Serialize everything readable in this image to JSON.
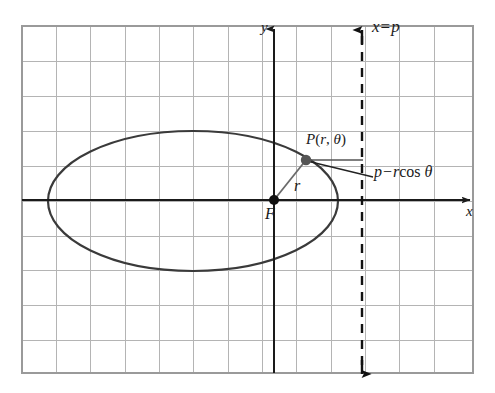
{
  "figure": {
    "kind": "polar-conic-diagram",
    "caption_glyph_partial": "g",
    "background_color": "#ffffff",
    "grid": {
      "visible": true,
      "line_color": "#b4b4b4",
      "border_color": "#9a9a9a",
      "cell_size_px": 34,
      "left_px": 22,
      "top_px": 26,
      "right_px": 473,
      "bottom_px": 373,
      "columns": 13,
      "rows": 10
    },
    "axes": {
      "color": "#1a1a1a",
      "x_axis": {
        "label": "x",
        "y_px": 200,
        "x_start_px": 22,
        "x_end_px": 477,
        "arrow": "right"
      },
      "y_axis": {
        "label": "y",
        "x_px": 274,
        "y_start_px": 373,
        "y_end_px": 22,
        "arrow": "up"
      },
      "origin_px": [
        274,
        200
      ]
    },
    "ellipse": {
      "stroke_color": "#3a3a3a",
      "stroke_width": 2.2,
      "center_px": [
        193,
        201
      ],
      "rx_px": 145,
      "ry_px": 70
    },
    "directrix": {
      "label": "x = p",
      "label_parts": {
        "var": "x",
        "op": "=",
        "param": "p"
      },
      "x_px": 362,
      "y_top_px": 26,
      "y_bottom_px": 377,
      "style": "dashed",
      "color": "#111111",
      "arrow_top": true,
      "arrow_bottom": true
    },
    "focus": {
      "label": "F",
      "point_px": [
        274,
        200
      ],
      "dot_radius_px": 5,
      "dot_color": "#111111"
    },
    "point_p": {
      "label": "P(r, θ)",
      "label_parts": {
        "name": "P",
        "open": "(",
        "r": "r",
        "comma": ", ",
        "theta": "θ",
        "close": ")"
      },
      "point_px": [
        306,
        160
      ],
      "dot_radius_px": 5,
      "dot_color": "#555555"
    },
    "radius": {
      "label": "r",
      "from_px": [
        274,
        200
      ],
      "to_px": [
        306,
        160
      ],
      "color": "#6a6a6a"
    },
    "horizontal_segment": {
      "from_px": [
        306,
        160
      ],
      "to_px": [
        362,
        160
      ],
      "color": "#555555",
      "description": "segment from P to directrix"
    },
    "leader_line": {
      "from_px": [
        307,
        161
      ],
      "to_px": [
        372,
        177
      ],
      "color": "#222222",
      "description": "callout pointer to distance label"
    },
    "distance_label": {
      "text": "p − r cos θ",
      "parts": {
        "p": "p",
        "minus": "−",
        "r": "r",
        "fn": "cos",
        "theta": "θ"
      }
    }
  }
}
